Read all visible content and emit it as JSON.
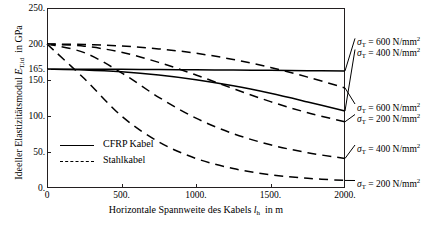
{
  "figure": {
    "caption": ""
  },
  "chart_data": {
    "type": "line",
    "title": "",
    "xlabel": "Horizontale Spannweite des Kabels l_h  in m",
    "xlabel_main": "Horizontale Spannweite des Kabels",
    "xlabel_symbol": "l",
    "xlabel_symbol_sub": "h",
    "xlabel_unit": "in m",
    "ylabel": "Ideeller Elastizitätsmodul E_T,id  in GPa",
    "ylabel_main": "Ideeller Elastizitätsmodul",
    "ylabel_symbol": "E",
    "ylabel_symbol_sub": "T,id",
    "ylabel_unit": "in GPa",
    "xlim": [
      0,
      2000
    ],
    "ylim": [
      0,
      250
    ],
    "xticks": [
      0,
      500,
      1000,
      1500,
      2000
    ],
    "xtick_labels": [
      "0",
      "500.",
      "1000.",
      "1500.",
      "2000."
    ],
    "yticks": [
      0,
      50,
      100,
      150,
      165,
      200,
      250
    ],
    "ytick_labels": [
      "0.",
      "50.",
      "100.",
      "150.",
      "165.",
      "200.",
      "250."
    ],
    "grid": false,
    "legend_position": "lower-left",
    "legend": [
      {
        "label": "CFRP Kabel",
        "style": "solid"
      },
      {
        "label": "Stahlkabel",
        "style": "dashed"
      }
    ],
    "series": [
      {
        "name": "CFRP Kabel, sigma_T = 600 N/mm2",
        "style": "solid",
        "material": "CFRP Kabel",
        "sigma_T": 600,
        "x": [
          0,
          250,
          500,
          750,
          1000,
          1250,
          1500,
          1750,
          2000
        ],
        "values": [
          165,
          165,
          164.8,
          164.5,
          164.2,
          163.8,
          163.4,
          163.0,
          162.6
        ]
      },
      {
        "name": "CFRP Kabel, sigma_T = 400 N/mm2",
        "style": "solid",
        "material": "CFRP Kabel",
        "sigma_T": 400,
        "x": [
          0,
          250,
          500,
          750,
          1000,
          1250,
          1500,
          1750,
          2000
        ],
        "values": [
          165,
          164.0,
          161.5,
          157.0,
          150.5,
          142.0,
          131.5,
          119.5,
          107.0
        ]
      },
      {
        "name": "Stahlkabel, sigma_T = 600 N/mm2",
        "style": "dashed",
        "material": "Stahlkabel",
        "sigma_T": 600,
        "x": [
          0,
          250,
          500,
          750,
          1000,
          1250,
          1500,
          1750,
          2000
        ],
        "values": [
          200,
          199.3,
          197.2,
          193.2,
          187.2,
          178.5,
          167.5,
          154.0,
          139.0
        ]
      },
      {
        "name": "Stahlkabel, sigma_T = 400 N/mm2",
        "style": "dashed",
        "material": "Stahlkabel",
        "sigma_T": 400,
        "x": [
          0,
          250,
          500,
          750,
          1000,
          1250,
          1500,
          1750,
          2000
        ],
        "values": [
          200,
          197.0,
          188.5,
          174.5,
          157.0,
          138.0,
          120.0,
          104.5,
          92.0
        ]
      },
      {
        "name": "Stahlkabel, sigma_T = 200 N/mm2 (upper branch)",
        "style": "dashed",
        "material": "Stahlkabel",
        "sigma_T": 200,
        "x": [
          0,
          250,
          500,
          750,
          1000,
          1250,
          1500,
          1750,
          2000
        ],
        "values": [
          200,
          188.0,
          160.0,
          126.0,
          97.0,
          75.5,
          60.0,
          49.0,
          41.0
        ]
      },
      {
        "name": "Stahlkabel, sigma_T = 200 N/mm2 (lower branch)",
        "style": "dashed",
        "material": "Stahlkabel",
        "sigma_T": 200,
        "x": [
          0,
          250,
          500,
          750,
          1000,
          1250,
          1500,
          1750,
          2000
        ],
        "values": [
          200,
          152.0,
          100.0,
          64.0,
          41.0,
          27.0,
          18.5,
          13.5,
          10.5
        ]
      }
    ],
    "annotations": [
      {
        "id": "ann-600-top",
        "sigma": "σ",
        "sub": "T",
        "text": " = 600 N/mm",
        "sup": "2",
        "value": 600
      },
      {
        "id": "ann-400-top",
        "sigma": "σ",
        "sub": "T",
        "text": " = 400 N/mm",
        "sup": "2",
        "value": 400
      },
      {
        "id": "ann-600-mid",
        "sigma": "σ",
        "sub": "T",
        "text": " = 600 N/mm",
        "sup": "2",
        "value": 600
      },
      {
        "id": "ann-200-mid",
        "sigma": "σ",
        "sub": "T",
        "text": " = 200 N/mm",
        "sup": "2",
        "value": 200
      },
      {
        "id": "ann-400-low",
        "sigma": "σ",
        "sub": "T",
        "text": " = 400 N/mm",
        "sup": "2",
        "value": 400
      },
      {
        "id": "ann-200-low",
        "sigma": "σ",
        "sub": "T",
        "text": " = 200 N/mm",
        "sup": "2",
        "value": 200
      }
    ]
  }
}
